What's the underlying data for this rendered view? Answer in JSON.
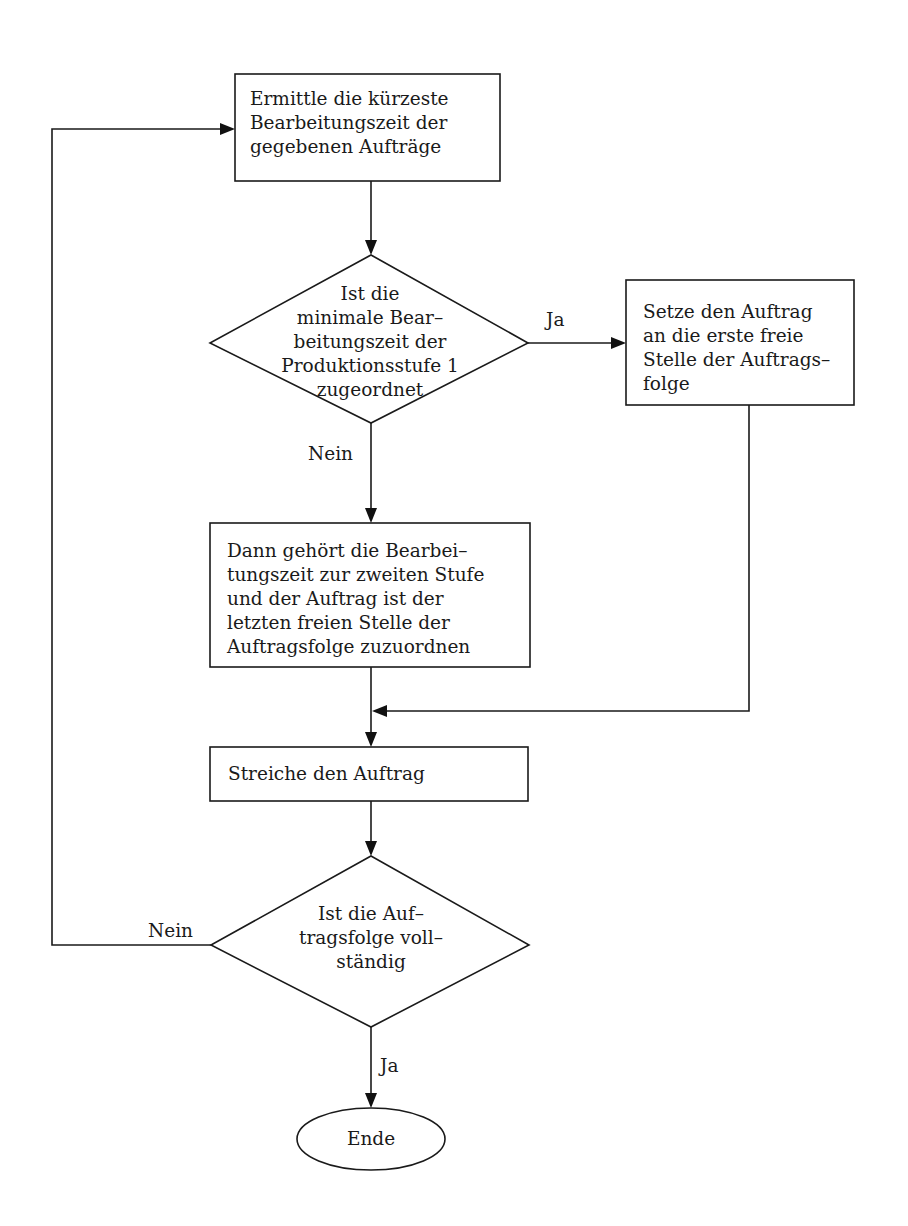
{
  "diagram": {
    "type": "flowchart",
    "nodes": {
      "start_box": {
        "shape": "rectangle",
        "lines": [
          "Ermittle die kürzeste",
          "Bearbeitungszeit der",
          "gegebenen Aufträge"
        ]
      },
      "decision_1": {
        "shape": "diamond",
        "lines": [
          "Ist die",
          "minimale Bear–",
          "beitungszeit der",
          "Produktionsstufe 1",
          "zugeordnet"
        ]
      },
      "yes_box": {
        "shape": "rectangle",
        "lines": [
          "Setze den Auftrag",
          "an die erste freie",
          "Stelle der Auftrags–",
          "folge"
        ]
      },
      "no_box": {
        "shape": "rectangle",
        "lines": [
          "Dann gehört die Bearbei–",
          "tungszeit zur zweiten Stufe",
          "und der Auftrag ist der",
          "letzten freien Stelle der",
          "Auftragsfolge zuzuordnen"
        ]
      },
      "strike_box": {
        "shape": "rectangle",
        "lines": [
          "Streiche den Auftrag"
        ]
      },
      "decision_2": {
        "shape": "diamond",
        "lines": [
          "Ist die Auf–",
          "tragsfolge voll–",
          "ständig"
        ]
      },
      "end": {
        "shape": "ellipse",
        "label": "Ende"
      }
    },
    "edge_labels": {
      "d1_yes": "Ja",
      "d1_no": "Nein",
      "d2_no": "Nein",
      "d2_yes": "Ja"
    },
    "colors": {
      "stroke": "#1a1a1a",
      "background": "#ffffff"
    }
  }
}
